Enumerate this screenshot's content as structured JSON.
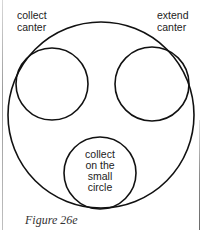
{
  "diagram": {
    "outer_circle": {
      "name": "large circle"
    },
    "small_circles": [
      {
        "id": "left",
        "label_lines": [
          "collect",
          "canter"
        ],
        "label_position": "outside-top-left"
      },
      {
        "id": "right",
        "label_lines": [
          "extend",
          "canter"
        ],
        "label_position": "outside-top-right"
      },
      {
        "id": "bottom",
        "label_lines": [
          "collect",
          "on the",
          "small",
          "circle"
        ],
        "label_position": "inside"
      }
    ],
    "stroke_color": "#111111"
  },
  "caption": "Figure 26e"
}
